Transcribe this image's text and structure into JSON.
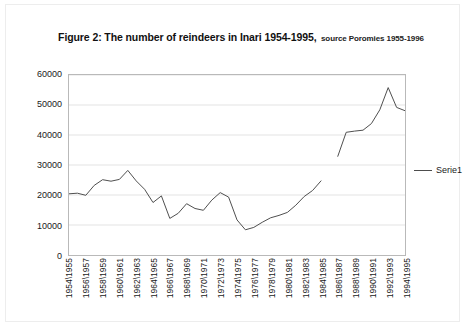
{
  "figure": {
    "title_main": "Figure 2: The number of reindeers in Inari 1954-1995,",
    "title_source": "source Poromies 1955-1996"
  },
  "legend": {
    "position": "right",
    "entries": [
      {
        "label": "Serie1",
        "color": "#4d4d4d",
        "marker": "line"
      }
    ]
  },
  "axes": {
    "y_ticks": [
      "0",
      "10000",
      "20000",
      "30000",
      "40000",
      "50000",
      "60000"
    ],
    "x_ticks": [
      "1954\\1955",
      "1956\\1957",
      "1958\\1959",
      "1960\\1961",
      "1962\\1963",
      "1964\\1965",
      "1966\\1967",
      "1968\\1969",
      "1970\\1971",
      "1972\\1973",
      "1974\\1975",
      "1976\\1977",
      "1978\\1979",
      "1980\\1981",
      "1982\\1983",
      "1984\\1985",
      "1986\\1987",
      "1988\\1989",
      "1990\\1991",
      "1992\\1993",
      "1994\\1995"
    ]
  },
  "chart_data": {
    "type": "line",
    "title": "Figure 2: The number of reindeers in Inari 1954-1995, source Poromies 1955-1996",
    "xlabel": "",
    "ylabel": "",
    "ylim": [
      0,
      60000
    ],
    "ytick_step": 10000,
    "grid": true,
    "grid_axis": "y",
    "legend_position": "right",
    "line_color": "#4d4d4d",
    "x_tick_interval": 2,
    "categories": [
      "1954\\1955",
      "1955\\1956",
      "1956\\1957",
      "1957\\1958",
      "1958\\1959",
      "1959\\1960",
      "1960\\1961",
      "1961\\1962",
      "1962\\1963",
      "1963\\1964",
      "1964\\1965",
      "1965\\1966",
      "1966\\1967",
      "1967\\1968",
      "1968\\1969",
      "1969\\1970",
      "1970\\1971",
      "1971\\1972",
      "1972\\1973",
      "1973\\1974",
      "1974\\1975",
      "1975\\1976",
      "1976\\1977",
      "1977\\1978",
      "1978\\1979",
      "1979\\1980",
      "1980\\1981",
      "1981\\1982",
      "1982\\1983",
      "1983\\1984",
      "1984\\1985",
      "1985\\1986",
      "1986\\1987",
      "1987\\1988",
      "1988\\1989",
      "1989\\1990",
      "1990\\1991",
      "1991\\1992",
      "1992\\1993",
      "1993\\1994",
      "1994\\1995"
    ],
    "series": [
      {
        "name": "Serie1",
        "color": "#4d4d4d",
        "values": [
          20400,
          20600,
          19900,
          23200,
          25100,
          24600,
          25200,
          28200,
          24700,
          21900,
          17500,
          19700,
          12200,
          13900,
          17100,
          15500,
          14900,
          18300,
          20800,
          19300,
          11700,
          8400,
          9200,
          10900,
          12400,
          13200,
          14200,
          16600,
          19500,
          21500,
          24700,
          null,
          32900,
          40900,
          41300,
          41600,
          43800,
          48400,
          55800,
          49200,
          48100
        ]
      }
    ]
  }
}
